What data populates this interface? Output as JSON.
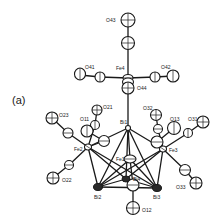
{
  "figure": {
    "panel_label": "(a)",
    "type": "ORTEP molecular structure",
    "atoms": {
      "O43": "O43",
      "O41": "O41",
      "O42": "O42",
      "O44": "O44",
      "Fe4": "Fe4",
      "O21": "O21",
      "O23": "O23",
      "O11": "O11",
      "O22": "O22",
      "Fe2": "Fe2",
      "Bi1": "Bi1",
      "Fe1": "Fe1",
      "Bi4": "Bi4",
      "Bi2": "Bi2",
      "Bi3": "Bi3",
      "O12": "O12",
      "O32": "O32",
      "O13": "O13",
      "O31": "O31",
      "Fe3": "Fe3",
      "O33": "O33"
    }
  }
}
